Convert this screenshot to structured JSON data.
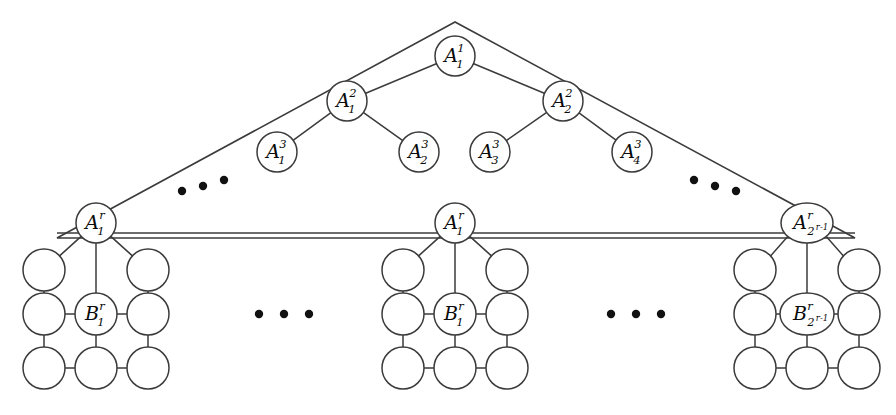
{
  "figure": {
    "kind": "graph-diagram",
    "colors": {
      "stroke": "#3b3b3b",
      "node_fill": "#ffffff",
      "label": "#0a0a0a",
      "dot": "#111111",
      "background": "#ffffff"
    }
  },
  "tree": {
    "levels": [
      {
        "level": 1,
        "nodes": [
          {
            "id": "a1-1",
            "base": "A",
            "sup": "1",
            "sub": "1",
            "cx": 455,
            "cy": 56,
            "rx": 20,
            "ry": 20,
            "sub_size": "script"
          }
        ]
      },
      {
        "level": 2,
        "nodes": [
          {
            "id": "a2-1",
            "base": "A",
            "sup": "2",
            "sub": "1",
            "cx": 347,
            "cy": 101,
            "rx": 20,
            "ry": 20,
            "sub_size": "script"
          },
          {
            "id": "a2-2",
            "base": "A",
            "sup": "2",
            "sub": "2",
            "cx": 563,
            "cy": 101,
            "rx": 20,
            "ry": 20,
            "sub_size": "script"
          }
        ]
      },
      {
        "level": 3,
        "nodes": [
          {
            "id": "a3-1",
            "base": "A",
            "sup": "3",
            "sub": "1",
            "cx": 277,
            "cy": 152,
            "rx": 20,
            "ry": 20,
            "sub_size": "script"
          },
          {
            "id": "a3-2",
            "base": "A",
            "sup": "3",
            "sub": "2",
            "cx": 419,
            "cy": 152,
            "rx": 20,
            "ry": 20,
            "sub_size": "script"
          },
          {
            "id": "a3-3",
            "base": "A",
            "sup": "3",
            "sub": "3",
            "cx": 490,
            "cy": 152,
            "rx": 20,
            "ry": 20,
            "sub_size": "script"
          },
          {
            "id": "a3-4",
            "base": "A",
            "sup": "3",
            "sub": "4",
            "cx": 632,
            "cy": 152,
            "rx": 20,
            "ry": 20,
            "sub_size": "script"
          }
        ]
      },
      {
        "level": "r",
        "nodes": [
          {
            "id": "ar-left",
            "base": "A",
            "sup": "r",
            "sub": "1",
            "cx": 96,
            "cy": 223,
            "rx": 20,
            "ry": 20,
            "sub_size": "script"
          },
          {
            "id": "ar-mid",
            "base": "A",
            "sup": "r",
            "sub": "1",
            "cx": 455,
            "cy": 223,
            "rx": 20,
            "ry": 20,
            "sub_size": "script"
          },
          {
            "id": "ar-right",
            "base": "A",
            "sup": "r",
            "sub": "2^{r-1}",
            "sub_main": "2",
            "sub_exp": "r-1",
            "cx": 807,
            "cy": 223,
            "rx": 26,
            "ry": 20,
            "sub_size": "script-small"
          }
        ]
      }
    ],
    "edges": [
      {
        "from": "a1-1",
        "to": "a2-1"
      },
      {
        "from": "a1-1",
        "to": "a2-2"
      },
      {
        "from": "a2-1",
        "to": "a3-1"
      },
      {
        "from": "a2-1",
        "to": "a3-2"
      },
      {
        "from": "a2-2",
        "to": "a3-3"
      },
      {
        "from": "a2-2",
        "to": "a3-4"
      }
    ]
  },
  "triangle": {
    "apex": {
      "x": 455,
      "y": 22
    },
    "left_tip": {
      "x": 57,
      "y": 238
    },
    "right_tip": {
      "x": 855,
      "y": 238
    },
    "baseline_y": 233
  },
  "ellipses": [
    {
      "id": "dots-tree-left",
      "orientation": "diagonal-up",
      "dots": [
        {
          "cx": 182,
          "cy": 191
        },
        {
          "cx": 203,
          "cy": 186
        },
        {
          "cx": 224,
          "cy": 180
        }
      ]
    },
    {
      "id": "dots-tree-right",
      "orientation": "diagonal-down",
      "dots": [
        {
          "cx": 694,
          "cy": 180
        },
        {
          "cx": 715,
          "cy": 186
        },
        {
          "cx": 736,
          "cy": 191
        }
      ]
    },
    {
      "id": "dots-grids-left",
      "orientation": "horizontal",
      "dots": [
        {
          "cx": 259,
          "cy": 314
        },
        {
          "cx": 284,
          "cy": 314
        },
        {
          "cx": 309,
          "cy": 314
        }
      ]
    },
    {
      "id": "dots-grids-right",
      "orientation": "horizontal",
      "dots": [
        {
          "cx": 611,
          "cy": 314
        },
        {
          "cx": 636,
          "cy": 314
        },
        {
          "cx": 661,
          "cy": 314
        }
      ]
    }
  ],
  "grids": [
    {
      "id": "grid-left",
      "anchor_node": "ar-left",
      "center_x": 96,
      "b_node": {
        "base": "B",
        "sup": "r",
        "sub": "1",
        "cx": 96,
        "cy": 314,
        "rx": 21,
        "ry": 21,
        "sub_size": "script"
      },
      "columns": [
        44,
        96,
        148
      ],
      "rows": [
        270,
        314,
        368
      ],
      "plain_radius": 21
    },
    {
      "id": "grid-middle",
      "anchor_node": "ar-mid",
      "center_x": 455,
      "b_node": {
        "base": "B",
        "sup": "r",
        "sub": "1",
        "cx": 455,
        "cy": 314,
        "rx": 21,
        "ry": 21,
        "sub_size": "script"
      },
      "columns": [
        403,
        455,
        507
      ],
      "rows": [
        270,
        314,
        368
      ],
      "plain_radius": 21
    },
    {
      "id": "grid-right",
      "anchor_node": "ar-right",
      "center_x": 807,
      "b_node": {
        "base": "B",
        "sup": "r",
        "sub": "2^{r-1}",
        "sub_main": "2",
        "sub_exp": "r-1",
        "cx": 807,
        "cy": 314,
        "rx": 27,
        "ry": 21,
        "sub_size": "script-small"
      },
      "columns": [
        755,
        807,
        859
      ],
      "rows": [
        270,
        314,
        368
      ],
      "plain_radius": 21
    }
  ],
  "labels": {
    "a_base": "A",
    "b_base": "B",
    "sup_1": "1",
    "sup_2": "2",
    "sup_3": "3",
    "sup_r": "r",
    "sub_1": "1",
    "sub_2": "2",
    "sub_3": "3",
    "sub_4": "4",
    "sub_pow_base": "2",
    "sub_pow_exp": "r-1"
  }
}
